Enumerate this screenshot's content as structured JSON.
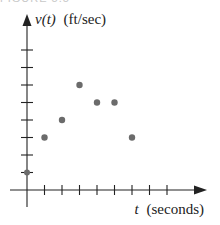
{
  "caption": "FIGURE 5.5",
  "chart_data": {
    "type": "scatter",
    "title": "",
    "xlabel": "t (seconds)",
    "ylabel": "v(t) (ft/sec)",
    "x_label_var": "t",
    "x_label_unit": "(seconds)",
    "y_label_var": "v(t)",
    "y_label_unit": "(ft/sec)",
    "x": [
      0,
      1,
      2,
      3,
      4,
      5,
      6
    ],
    "y": [
      1,
      3,
      4,
      6,
      5,
      5,
      3
    ],
    "xlim": [
      0,
      8.5
    ],
    "ylim": [
      0,
      9
    ],
    "x_ticks": [
      1,
      2,
      3,
      4,
      5,
      6,
      7,
      8
    ],
    "y_ticks": [
      1,
      2,
      3,
      4,
      5,
      6,
      7,
      8
    ],
    "tick_labels_shown": false,
    "grid": false,
    "legend": null,
    "point_color": "#6b6b6b"
  }
}
